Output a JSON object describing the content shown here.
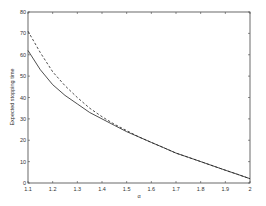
{
  "chart_data": {
    "type": "line",
    "title": "",
    "xlabel": "α",
    "ylabel": "Expected stopping time",
    "xlim": [
      1.1,
      2.0
    ],
    "ylim": [
      0,
      80
    ],
    "grid": false,
    "legend": null,
    "xticks": [
      "1.1",
      "1.2",
      "1.3",
      "1.4",
      "1.5",
      "1.6",
      "1.7",
      "1.8",
      "1.9",
      "2"
    ],
    "yticks": [
      "0",
      "10",
      "20",
      "30",
      "40",
      "50",
      "60",
      "70",
      "80"
    ],
    "x": [
      1.1,
      1.15,
      1.2,
      1.25,
      1.3,
      1.35,
      1.4,
      1.45,
      1.5,
      1.55,
      1.6,
      1.65,
      1.7,
      1.75,
      1.8,
      1.85,
      1.9,
      1.95,
      2.0
    ],
    "series": [
      {
        "name": "solid",
        "style": "solid",
        "color": "#222222",
        "values": [
          62,
          53,
          46,
          41,
          37,
          33,
          30,
          27,
          24,
          21.5,
          19,
          16.5,
          14,
          12,
          10,
          8,
          6,
          4,
          2
        ]
      },
      {
        "name": "dashed",
        "style": "dashed",
        "color": "#222222",
        "values": [
          71,
          61,
          52,
          45.5,
          40,
          35,
          31,
          27.5,
          24.5,
          21.5,
          19,
          16.5,
          14,
          12,
          10,
          8,
          6,
          4,
          2
        ]
      }
    ]
  }
}
